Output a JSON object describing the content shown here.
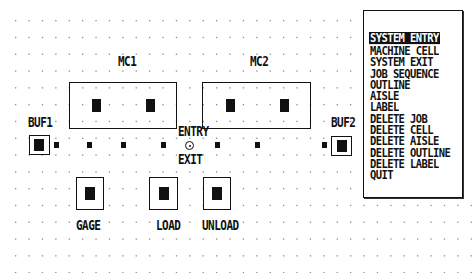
{
  "menu": {
    "items": [
      {
        "label": "SYSTEM ENTRY",
        "selected": true
      },
      {
        "label": "MACHINE CELL",
        "selected": false
      },
      {
        "label": "SYSTEM EXIT",
        "selected": false
      },
      {
        "label": "JOB SEQUENCE",
        "selected": false
      },
      {
        "label": "OUTLINE",
        "selected": false
      },
      {
        "label": "AISLE",
        "selected": false
      },
      {
        "label": "LABEL",
        "selected": false
      },
      {
        "label": "DELETE JOB",
        "selected": false
      },
      {
        "label": "DELETE CELL",
        "selected": false
      },
      {
        "label": "DELETE AISLE",
        "selected": false
      },
      {
        "label": "DELETE OUTLINE",
        "selected": false
      },
      {
        "label": "DELETE LABEL",
        "selected": false
      },
      {
        "label": "QUIT",
        "selected": false
      }
    ]
  },
  "layout": {
    "cells": {
      "mc1": "MC1",
      "mc2": "MC2",
      "buf1": "BUF1",
      "buf2": "BUF2",
      "gage": "GAGE",
      "load": "LOAD",
      "unload": "UNLOAD"
    },
    "node": {
      "entry": "ENTRY",
      "exit": "EXIT"
    }
  },
  "colors": {
    "background": "#ffffff",
    "foreground": "#111111",
    "grid_dot": "#8a8a8a"
  }
}
